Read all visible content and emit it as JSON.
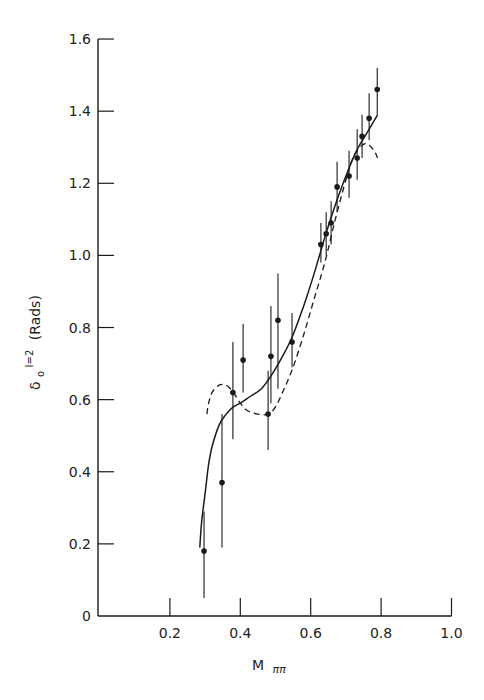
{
  "chart_data": {
    "type": "scatter",
    "title": "",
    "xlabel": "M ππ",
    "ylabel": "δ₀ I=2 (Rads)",
    "ylabel_parts": {
      "symbol": "δ",
      "subscript": "o",
      "superscript": "I=2",
      "unit": "(Rads)"
    },
    "xlabel_parts": {
      "main": "M",
      "subscript": "ππ"
    },
    "xlim": [
      0,
      1.0
    ],
    "ylim": [
      0,
      1.6
    ],
    "grid": false,
    "legend": null,
    "x_ticks": [
      0.2,
      0.4,
      0.6,
      0.8,
      1.0
    ],
    "x_tick_labels": [
      "0.2",
      "0.4",
      "0.6",
      "0.8",
      "1.0"
    ],
    "y_ticks": [
      0,
      0.2,
      0.4,
      0.6,
      0.8,
      1.0,
      1.2,
      1.4,
      1.6
    ],
    "y_tick_labels": [
      "0",
      "0.2",
      "0.4",
      "0.6",
      "0.8",
      "1.0",
      "1.2",
      "1.4",
      "1.6"
    ],
    "series": [
      {
        "name": "data",
        "kind": "points_with_error_bars",
        "points": [
          {
            "x": 0.297,
            "y": 0.18,
            "ylo": 0.05,
            "yhi": 0.29
          },
          {
            "x": 0.348,
            "y": 0.37,
            "ylo": 0.19,
            "yhi": 0.56
          },
          {
            "x": 0.379,
            "y": 0.62,
            "ylo": 0.49,
            "yhi": 0.76
          },
          {
            "x": 0.408,
            "y": 0.71,
            "ylo": 0.62,
            "yhi": 0.81
          },
          {
            "x": 0.479,
            "y": 0.56,
            "ylo": 0.46,
            "yhi": 0.68
          },
          {
            "x": 0.487,
            "y": 0.72,
            "ylo": 0.59,
            "yhi": 0.86
          },
          {
            "x": 0.507,
            "y": 0.82,
            "ylo": 0.63,
            "yhi": 0.95
          },
          {
            "x": 0.547,
            "y": 0.76,
            "ylo": 0.69,
            "yhi": 0.84
          },
          {
            "x": 0.629,
            "y": 1.03,
            "ylo": 0.98,
            "yhi": 1.09
          },
          {
            "x": 0.644,
            "y": 1.06,
            "ylo": 1.0,
            "yhi": 1.12
          },
          {
            "x": 0.658,
            "y": 1.09,
            "ylo": 1.03,
            "yhi": 1.15
          },
          {
            "x": 0.675,
            "y": 1.19,
            "ylo": 1.12,
            "yhi": 1.26
          },
          {
            "x": 0.709,
            "y": 1.22,
            "ylo": 1.16,
            "yhi": 1.29
          },
          {
            "x": 0.732,
            "y": 1.27,
            "ylo": 1.21,
            "yhi": 1.35
          },
          {
            "x": 0.746,
            "y": 1.33,
            "ylo": 1.27,
            "yhi": 1.39
          },
          {
            "x": 0.766,
            "y": 1.38,
            "ylo": 1.32,
            "yhi": 1.45
          },
          {
            "x": 0.789,
            "y": 1.46,
            "ylo": 1.39,
            "yhi": 1.52
          }
        ]
      },
      {
        "name": "solid fit",
        "kind": "line",
        "style": "solid",
        "x": [
          0.285,
          0.29,
          0.3,
          0.31,
          0.32,
          0.34,
          0.36,
          0.38,
          0.4,
          0.43,
          0.46,
          0.49,
          0.52,
          0.55,
          0.58,
          0.61,
          0.64,
          0.67,
          0.7,
          0.73,
          0.76,
          0.79
        ],
        "y": [
          0.19,
          0.26,
          0.34,
          0.42,
          0.47,
          0.53,
          0.56,
          0.58,
          0.59,
          0.61,
          0.63,
          0.67,
          0.72,
          0.78,
          0.86,
          0.95,
          1.05,
          1.14,
          1.22,
          1.29,
          1.34,
          1.39
        ]
      },
      {
        "name": "dashed fit",
        "kind": "line",
        "style": "dashed",
        "x": [
          0.305,
          0.31,
          0.32,
          0.34,
          0.36,
          0.38,
          0.4,
          0.42,
          0.45,
          0.48,
          0.5,
          0.52,
          0.55,
          0.58,
          0.61,
          0.64,
          0.67,
          0.7,
          0.72,
          0.74,
          0.76,
          0.78,
          0.79
        ],
        "y": [
          0.56,
          0.59,
          0.62,
          0.64,
          0.64,
          0.62,
          0.59,
          0.57,
          0.56,
          0.56,
          0.58,
          0.62,
          0.69,
          0.78,
          0.88,
          0.98,
          1.1,
          1.21,
          1.27,
          1.3,
          1.31,
          1.29,
          1.27
        ]
      }
    ],
    "colors": {
      "ink": "#1a1a1a",
      "background": "#ffffff"
    }
  }
}
